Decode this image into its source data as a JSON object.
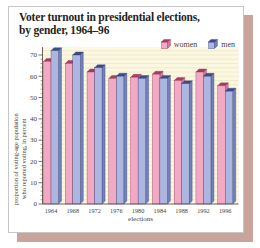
{
  "window": {
    "background": "#ffffff"
  },
  "card": {
    "background": "#ffffff",
    "border_color": "#c6c6c6",
    "shadow_color": "#c9a49a"
  },
  "title": "Voter turnout in presidential elections,\nby gender, 1964–96",
  "legend": {
    "women_label": "women",
    "men_label": "men"
  },
  "axes": {
    "ylabel": "proportion of voting-age population\nwho reported voting, in percent",
    "xlabel": "elections"
  },
  "chart_data": {
    "type": "bar",
    "title": "Voter turnout in presidential elections, by gender, 1964–96",
    "categories": [
      "1964",
      "1968",
      "1972",
      "1976",
      "1980",
      "1984",
      "1988",
      "1992",
      "1996"
    ],
    "series": [
      {
        "name": "women",
        "values": [
          67,
          66,
          62,
          59,
          59.5,
          61,
          58,
          62,
          55.5
        ],
        "color": "#f2aac4",
        "side_color": "#d07d9e",
        "top_color": "#a83e62",
        "edge_color": "#8f2c4e"
      },
      {
        "name": "men",
        "values": [
          72,
          70,
          64,
          60,
          59,
          59,
          56.5,
          60,
          53
        ],
        "color": "#adb6e0",
        "side_color": "#7381b8",
        "top_color": "#3c4c88",
        "edge_color": "#2f3c74"
      }
    ],
    "xlabel": "elections",
    "ylabel": "proportion of voting-age population who reported voting, in percent",
    "ylim": [
      0,
      70
    ],
    "ytick_step": 10,
    "minor_tick_step": 2,
    "grid": true,
    "legend_position": "top-right",
    "plot_bg": "#fbf7e0",
    "grid_color": "#e6dfba",
    "axis_color": "#5a4f45",
    "text_color": "#4a3f38"
  }
}
